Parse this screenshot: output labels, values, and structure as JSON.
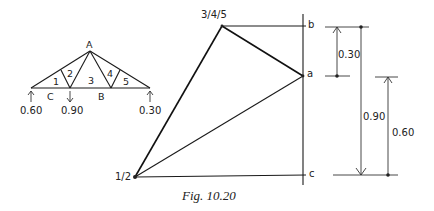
{
  "figure": {
    "caption": "Fig. 10.20"
  },
  "truss": {
    "apex_label": "A",
    "bottom_labels": {
      "left": "C",
      "right": "B"
    },
    "panel_labels": [
      "1",
      "2",
      "3",
      "4",
      "5"
    ],
    "reactions": {
      "left": {
        "value": "0.60",
        "direction": "up"
      },
      "middle": {
        "value": "0.90",
        "direction": "down"
      },
      "right": {
        "value": "0.30",
        "direction": "up"
      }
    }
  },
  "force_diagram": {
    "point_labels": {
      "p345": "3/4/5",
      "p12": "1/2",
      "b": "b",
      "a": "a",
      "c": "c"
    }
  },
  "dimensions": {
    "ab": "0.30",
    "bc": "0.90",
    "ac": "0.60"
  },
  "colors": {
    "ink": "#1a1a1a",
    "background": "#ffffff"
  }
}
